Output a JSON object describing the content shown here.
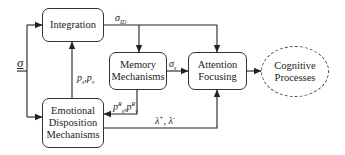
{
  "nodes": {
    "integration": {
      "label": "Integration"
    },
    "memory": {
      "label": "Memory\nMechanisms"
    },
    "attention": {
      "label": "Attention\nFocusing"
    },
    "cognitive": {
      "label": "Cognitive\nProcesses"
    },
    "emotional": {
      "label": "Emotional\nDisposition\nMechanisms"
    }
  },
  "edges": {
    "input_sigma": {
      "symbol": "σ"
    },
    "sigma_id": {
      "symbol": "σ",
      "sub": "ID"
    },
    "sigma_s": {
      "symbol": "σ",
      "sub": "s"
    },
    "p_feedback": {
      "p1": "p",
      "p1_sub": "s",
      "sep": ",",
      "p2": "p",
      "p2_sub": "v"
    },
    "p_r": {
      "p1": "p",
      "p1_sub": "s",
      "p1_sup": "R",
      "sep": ",",
      "p2": "p",
      "p2_sub": "v",
      "p2_sup": "R"
    },
    "lambda": {
      "l1": "λ",
      "l1_sup": "+",
      "sep": ", ",
      "l2": "λ",
      "l2_sup": "-"
    }
  },
  "colors": {
    "line": "#222222",
    "box_border": "#333333",
    "background": "#ffffff"
  }
}
